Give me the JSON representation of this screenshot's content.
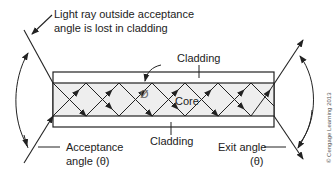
{
  "labels": {
    "lost_ray_line1": "Light ray outside acceptance",
    "lost_ray_line2": "angle is lost in cladding",
    "cladding_top": "Cladding",
    "cladding_bottom": "Cladding",
    "core": "Core",
    "critical_angle_symbol": "Ø",
    "acceptance_line1": "Acceptance",
    "acceptance_line2": "angle (θ)",
    "exit_line1": "Exit angle",
    "exit_line2": "(θ)",
    "copyright": "© Cengage Learning 2013"
  },
  "colors": {
    "stroke": "#222222",
    "core_fill": "#eeeeee",
    "cladding_fill": "#ffffff",
    "text": "#222222"
  }
}
